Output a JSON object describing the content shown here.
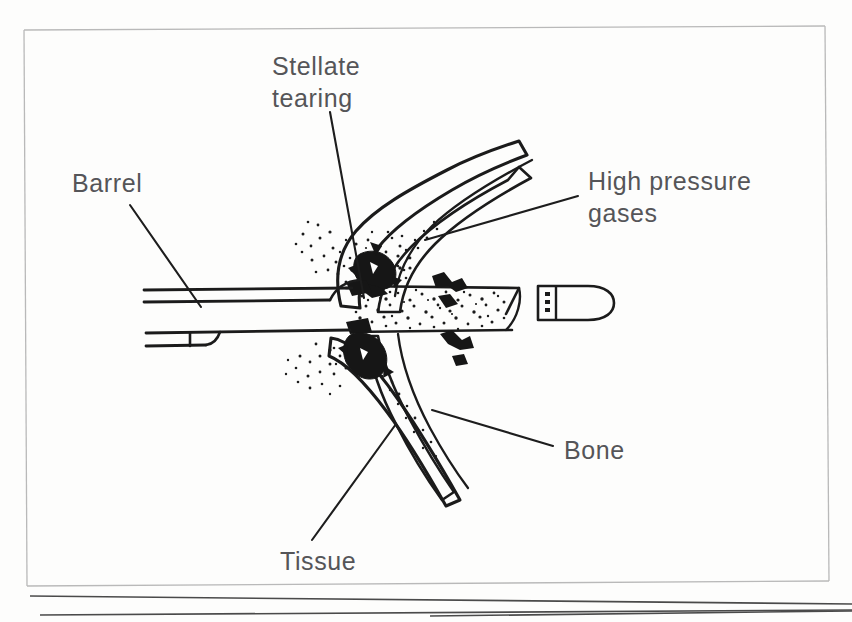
{
  "figure": {
    "background_color": "#fdfdfc",
    "ink_color": "#1b1b1b",
    "label_color": "#555558",
    "frame_color": "#b9b9b9"
  },
  "labels": {
    "barrel": "Barrel",
    "stellate_tearing_line1": "Stellate",
    "stellate_tearing_line2": "tearing",
    "high_pressure_line1": "High pressure",
    "high_pressure_line2": "gases",
    "bone": "Bone",
    "tissue": "Tissue"
  },
  "parts": [
    {
      "name": "barrel",
      "label": "Barrel",
      "description": "Firearm barrel in longitudinal section entering tissue from the left"
    },
    {
      "name": "stellate-tearing",
      "label": "Stellate tearing",
      "description": "Star-shaped skin tears radiating from the entrance wound"
    },
    {
      "name": "high-pressure-gases",
      "label": "High pressure gases",
      "description": "Propellant gases expanding into the wound cavity"
    },
    {
      "name": "bone",
      "label": "Bone",
      "description": "Bone layer beneath the torn tissue flaps"
    },
    {
      "name": "tissue",
      "label": "Tissue",
      "description": "Soft tissue flaps lifted away from the bone"
    },
    {
      "name": "bullet",
      "label": "",
      "description": "Round-nosed bullet with cannelure travelling to the right"
    }
  ],
  "stipple": {
    "gas_cloud_seed": 1729,
    "dense_core_seed": 88
  }
}
